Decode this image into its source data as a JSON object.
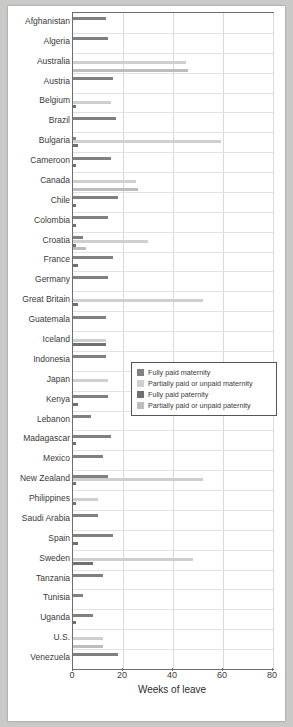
{
  "chart_data": {
    "type": "bar",
    "orientation": "horizontal",
    "title": "",
    "xlabel": "Weeks of leave",
    "ylabel": "",
    "xlim": [
      0,
      80
    ],
    "xticks": [
      0,
      20,
      40,
      60,
      80
    ],
    "grid": true,
    "legend_position": "center-right-inside",
    "legend": [
      "Fully paid maternity",
      "Partially paid or unpaid maternity",
      "Fully paid paternity",
      "Partially paid or unpaid paternity"
    ],
    "colors": [
      "#808080",
      "#cfcfcf",
      "#707070",
      "#bdbdbd"
    ],
    "categories": [
      "Afghanistan",
      "Algeria",
      "Australia",
      "Austria",
      "Belgium",
      "Brazil",
      "Bulgaria",
      "Cameroon",
      "Canada",
      "Chile",
      "Colombia",
      "Croatia",
      "France",
      "Germany",
      "Great Britain",
      "Guatemala",
      "Iceland",
      "Indonesia",
      "Japan",
      "Kenya",
      "Lebanon",
      "Madagascar",
      "Mexico",
      "New Zealand",
      "Philippines",
      "Saudi Arabia",
      "Spain",
      "Sweden",
      "Tanzania",
      "Tunisia",
      "Uganda",
      "U.S.",
      "Venezuela"
    ],
    "series": [
      {
        "name": "Fully paid maternity",
        "values": [
          13,
          14,
          0,
          16,
          0,
          17,
          1,
          15,
          0,
          18,
          14,
          4,
          16,
          14,
          0,
          13,
          0,
          13,
          0,
          14,
          7,
          15,
          12,
          14,
          0,
          10,
          16,
          0,
          12,
          4,
          8,
          0,
          18
        ]
      },
      {
        "name": "Partially paid or unpaid maternity",
        "values": [
          0,
          0,
          45,
          0,
          15,
          0,
          59,
          0,
          25,
          0,
          0,
          30,
          0,
          0,
          52,
          0,
          13,
          0,
          14,
          0,
          0,
          0,
          0,
          52,
          10,
          0,
          0,
          48,
          0,
          0,
          0,
          12,
          0
        ]
      },
      {
        "name": "Fully paid paternity",
        "values": [
          0,
          0,
          0,
          0,
          1,
          0,
          2,
          1,
          0,
          1,
          1,
          1,
          2,
          0,
          2,
          0,
          13,
          0,
          0,
          2,
          0,
          1,
          0,
          1,
          1,
          0,
          2,
          8,
          0,
          0,
          1,
          0,
          0
        ]
      },
      {
        "name": "Partially paid or unpaid paternity",
        "values": [
          0,
          0,
          46,
          0,
          0,
          0,
          0,
          0,
          26,
          0,
          0,
          5,
          0,
          0,
          0,
          0,
          0,
          0,
          0,
          0,
          0,
          0,
          0,
          0,
          0,
          0,
          0,
          0,
          0,
          0,
          0,
          12,
          0
        ]
      }
    ]
  }
}
